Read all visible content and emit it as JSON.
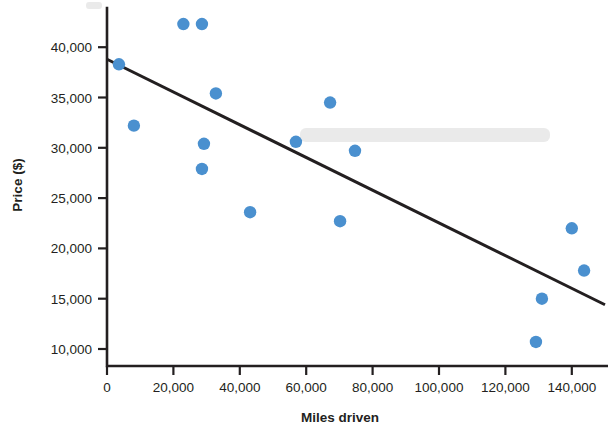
{
  "chart_data": {
    "type": "scatter",
    "title": "",
    "xlabel": "Miles driven",
    "ylabel": "Price ($)",
    "xlim": [
      0,
      150000
    ],
    "ylim": [
      7500,
      44000
    ],
    "grid": false,
    "legend": "none",
    "marker_color": "#4a90cf",
    "line_color": "#231f20",
    "axis_color": "#231f20",
    "x_ticks": [
      0,
      20000,
      40000,
      60000,
      80000,
      100000,
      120000,
      140000
    ],
    "x_tick_labels": [
      "0",
      "20,000",
      "40,000",
      "60,000",
      "80,000",
      "100,000",
      "120,000",
      "140,000"
    ],
    "y_ticks": [
      10000,
      15000,
      20000,
      25000,
      30000,
      35000,
      40000
    ],
    "y_tick_labels": [
      "10,000",
      "15,000",
      "20,000",
      "25,000",
      "30,000",
      "35,000",
      "40,000"
    ],
    "points": [
      {
        "x": 3600,
        "y": 38300
      },
      {
        "x": 8100,
        "y": 32200
      },
      {
        "x": 23000,
        "y": 42300
      },
      {
        "x": 28600,
        "y": 42300
      },
      {
        "x": 29200,
        "y": 30400
      },
      {
        "x": 28600,
        "y": 27900
      },
      {
        "x": 32800,
        "y": 35400
      },
      {
        "x": 43100,
        "y": 23600
      },
      {
        "x": 56900,
        "y": 30600
      },
      {
        "x": 67200,
        "y": 34500
      },
      {
        "x": 70200,
        "y": 22700
      },
      {
        "x": 74700,
        "y": 29700
      },
      {
        "x": 131000,
        "y": 15000
      },
      {
        "x": 129200,
        "y": 10700
      },
      {
        "x": 140000,
        "y": 22000
      },
      {
        "x": 143700,
        "y": 17800
      }
    ],
    "trend_line": {
      "name": "line of best fit",
      "x_start": 0,
      "y_start": 38800,
      "x_end": 150000,
      "y_end": 14400
    }
  }
}
